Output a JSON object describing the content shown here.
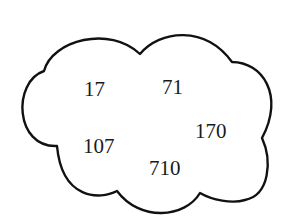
{
  "diagram": {
    "shape": "cloud",
    "stroke_color": "#111111",
    "background": "#ffffff",
    "numbers": [
      {
        "label": "17",
        "x": 84,
        "y": 96
      },
      {
        "label": "71",
        "x": 162,
        "y": 94
      },
      {
        "label": "107",
        "x": 83,
        "y": 153
      },
      {
        "label": "170",
        "x": 195,
        "y": 138
      },
      {
        "label": "710",
        "x": 149,
        "y": 175
      }
    ]
  }
}
